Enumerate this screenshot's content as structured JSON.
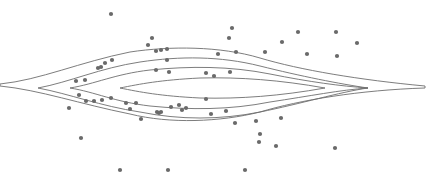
{
  "chart_data": {
    "type": "scatter",
    "subtype": "density-contour-with-scatter",
    "title": "",
    "xlabel": "",
    "ylabel": "",
    "axes_visible": false,
    "grid": false,
    "legend": null,
    "contour_levels": [
      {
        "level": 1,
        "fill": "#f2f2f2",
        "half_height": 22,
        "x_left": 0,
        "x_right": 430
      },
      {
        "level": 2,
        "fill": "#d9d9d9",
        "half_height": 18,
        "x_left": 38,
        "x_right": 365
      },
      {
        "level": 3,
        "fill": "#bdbdbd",
        "half_height": 13,
        "x_left": 70,
        "x_right": 368
      },
      {
        "level": 4,
        "fill": "#a3a3a3",
        "half_height": 8,
        "x_left": 118,
        "x_right": 325
      }
    ],
    "center": {
      "x": 215,
      "y": 88
    },
    "points": [
      [
        111,
        14
      ],
      [
        152,
        38
      ],
      [
        148,
        45
      ],
      [
        161,
        50
      ],
      [
        156,
        51
      ],
      [
        167,
        49
      ],
      [
        232,
        28
      ],
      [
        229,
        38
      ],
      [
        236,
        52
      ],
      [
        265,
        52
      ],
      [
        282,
        42
      ],
      [
        298,
        32
      ],
      [
        307,
        54
      ],
      [
        336,
        32
      ],
      [
        337,
        56
      ],
      [
        357,
        43
      ],
      [
        218,
        54
      ],
      [
        98,
        68
      ],
      [
        101,
        67
      ],
      [
        105,
        63
      ],
      [
        112,
        60
      ],
      [
        167,
        60
      ],
      [
        156,
        70
      ],
      [
        169,
        72
      ],
      [
        230,
        72
      ],
      [
        214,
        76
      ],
      [
        206,
        73
      ],
      [
        76,
        81
      ],
      [
        85,
        80
      ],
      [
        206,
        99
      ],
      [
        79,
        95
      ],
      [
        86,
        101
      ],
      [
        94,
        101
      ],
      [
        102,
        100
      ],
      [
        111,
        98
      ],
      [
        69,
        108
      ],
      [
        126,
        103
      ],
      [
        136,
        103
      ],
      [
        130,
        109
      ],
      [
        141,
        119
      ],
      [
        157,
        112
      ],
      [
        159,
        113
      ],
      [
        161,
        112
      ],
      [
        171,
        107
      ],
      [
        179,
        105
      ],
      [
        182,
        110
      ],
      [
        186,
        108
      ],
      [
        211,
        114
      ],
      [
        226,
        111
      ],
      [
        256,
        121
      ],
      [
        281,
        118
      ],
      [
        235,
        123
      ],
      [
        260,
        134
      ],
      [
        259,
        142
      ],
      [
        276,
        146
      ],
      [
        335,
        148
      ],
      [
        120,
        170
      ],
      [
        245,
        170
      ],
      [
        81,
        138
      ],
      [
        168,
        170
      ]
    ]
  }
}
